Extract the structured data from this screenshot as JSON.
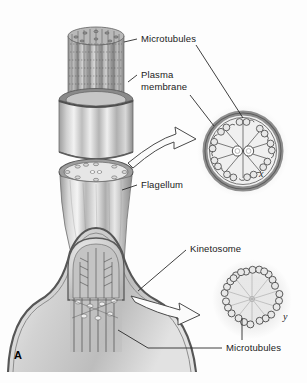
{
  "figure": {
    "panel_label": "A",
    "background_color": "#fdfdfd",
    "ink_color": "#1b1b1b"
  },
  "labels": {
    "microtubules_top": "Microtubules",
    "plasma_membrane": "Plasma\nmembrane",
    "flagellum": "Flagellum",
    "kinetosome": "Kinetosome",
    "microtubules_bottom": "Microtubules"
  },
  "insets": {
    "axoneme": {
      "key": "x",
      "outer_doublets": 9,
      "central_singlets": 2,
      "pattern": "9+2"
    },
    "kinetosome": {
      "key": "y",
      "outer_triplets": 9,
      "central_singlets": 0,
      "pattern": "9+0"
    }
  },
  "palette": {
    "membrane_dark": "#6f6f6f",
    "membrane_mid": "#9a9a9a",
    "tubule_fill": "#d6d6d6",
    "tubule_stroke": "#5a5a5a",
    "cell_body": "#c9c9c9",
    "shaft_light": "#f0f0f0",
    "shaft_dark": "#8d8d8d",
    "leader_line": "#2a2a2a"
  }
}
